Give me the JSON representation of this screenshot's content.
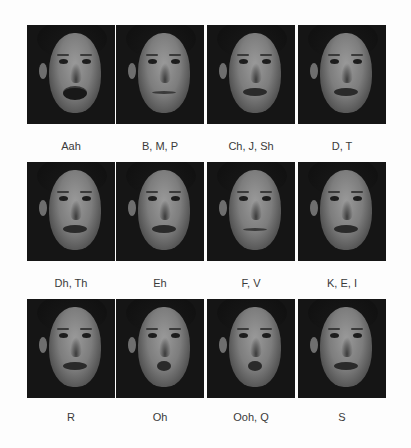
{
  "figure": {
    "cells": [
      {
        "label": "Aah",
        "mouth": "open"
      },
      {
        "label": "B, M, P",
        "mouth": "closed"
      },
      {
        "label": "Ch, J, Sh",
        "mouth": "mid"
      },
      {
        "label": "D, T",
        "mouth": "mid"
      },
      {
        "label": "Dh, Th",
        "mouth": "mid"
      },
      {
        "label": "Eh",
        "mouth": "mid"
      },
      {
        "label": "F, V",
        "mouth": "closed"
      },
      {
        "label": "K, E, I",
        "mouth": "mid"
      },
      {
        "label": "R",
        "mouth": "mid"
      },
      {
        "label": "Oh",
        "mouth": "round"
      },
      {
        "label": "Ooh, Q",
        "mouth": "round"
      },
      {
        "label": "S",
        "mouth": "mid"
      }
    ]
  }
}
